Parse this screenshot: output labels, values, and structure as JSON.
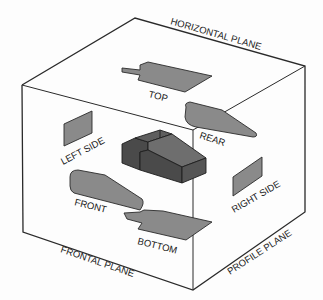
{
  "diagram": {
    "planes": {
      "horizontal": "HORIZONTAL PLANE",
      "frontal": "FRONTAL PLANE",
      "profile": "PROFILE PLANE"
    },
    "views": {
      "top": "TOP",
      "rear": "REAR",
      "left_side": "LEFT SIDE",
      "right_side": "RIGHT SIDE",
      "front": "FRONT",
      "bottom": "BOTTOM"
    },
    "colors": {
      "edge": "#2a2a2a",
      "projection_fill": "#8a8a8a",
      "object_dark": "#4a4a4a",
      "object_mid": "#5e5e5e",
      "object_light": "#6e6e6e"
    }
  }
}
